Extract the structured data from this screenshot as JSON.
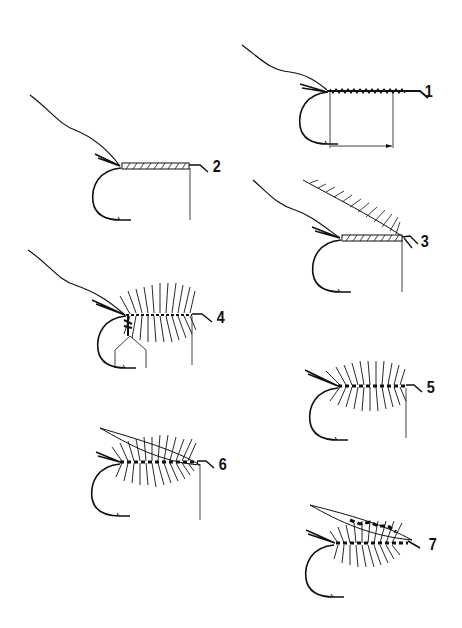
{
  "diagram": {
    "ink_color": "#111111",
    "steps": [
      {
        "label": "1",
        "description": "Thread wrapped along hook shank, tail tied in, with measurement arrow"
      },
      {
        "label": "2",
        "description": "Tinsel body wound along shank"
      },
      {
        "label": "3",
        "description": "Hackle feather tied in at head"
      },
      {
        "label": "4",
        "description": "Hackle palmered along body, ribbing tied in"
      },
      {
        "label": "5",
        "description": "Palmered hackle and rib complete"
      },
      {
        "label": "6",
        "description": "Wing tied on top"
      },
      {
        "label": "7",
        "description": "Finished fly with wing"
      }
    ]
  }
}
